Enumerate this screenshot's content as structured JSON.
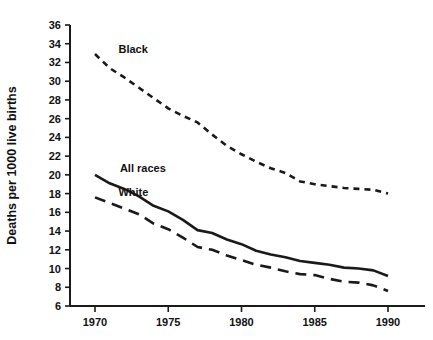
{
  "chart_data": {
    "type": "line",
    "title": "",
    "subtitle": "",
    "xlabel": "",
    "ylabel": "Deaths per 1000 live births",
    "xlim": [
      1969,
      1991
    ],
    "ylim": [
      6,
      36
    ],
    "ytick_step": 2,
    "xtick_step": 5,
    "grid": false,
    "legend_position": "inline-annotation",
    "xticks": [
      1970,
      1975,
      1980,
      1985,
      1990
    ],
    "xtick_labels": [
      "1970",
      "1975",
      "1980",
      "1985",
      "1990"
    ],
    "yticks": [
      6,
      8,
      10,
      12,
      14,
      16,
      18,
      20,
      22,
      24,
      26,
      28,
      30,
      32,
      34,
      36
    ],
    "ytick_labels": [
      "6",
      "8",
      "10",
      "12",
      "14",
      "16",
      "18",
      "20",
      "22",
      "24",
      "26",
      "28",
      "30",
      "32",
      "34",
      "36"
    ],
    "x": [
      1970,
      1971,
      1972,
      1973,
      1974,
      1975,
      1976,
      1977,
      1978,
      1979,
      1980,
      1981,
      1982,
      1983,
      1984,
      1985,
      1986,
      1987,
      1988,
      1989,
      1990
    ],
    "series": [
      {
        "name": "Black",
        "line_style": "dotted",
        "color": "#1a1a1a",
        "label": "Black",
        "values": [
          32.9,
          31.4,
          30.4,
          29.3,
          28.2,
          27.1,
          26.3,
          25.6,
          24.3,
          23.1,
          22.2,
          21.4,
          20.7,
          20.2,
          19.3,
          19.0,
          18.8,
          18.6,
          18.5,
          18.4,
          18.0
        ]
      },
      {
        "name": "All races",
        "line_style": "solid",
        "color": "#1a1a1a",
        "label": "All races",
        "values": [
          20.0,
          19.1,
          18.5,
          17.7,
          16.7,
          16.1,
          15.2,
          14.1,
          13.8,
          13.1,
          12.6,
          11.9,
          11.5,
          11.2,
          10.8,
          10.6,
          10.4,
          10.1,
          10.0,
          9.8,
          9.2
        ]
      },
      {
        "name": "White",
        "line_style": "dashed",
        "color": "#1a1a1a",
        "label": "White",
        "values": [
          17.6,
          17.0,
          16.4,
          15.8,
          14.8,
          14.2,
          13.3,
          12.3,
          12.0,
          11.4,
          10.9,
          10.4,
          10.1,
          9.7,
          9.4,
          9.3,
          8.9,
          8.6,
          8.5,
          8.2,
          7.6
        ]
      }
    ],
    "annotations": [
      {
        "text": "Black",
        "x": 1971.6,
        "y": 33.4
      },
      {
        "text": "All races",
        "x": 1971.7,
        "y": 20.7
      },
      {
        "text": "White",
        "x": 1971.6,
        "y": 18.2
      }
    ]
  }
}
